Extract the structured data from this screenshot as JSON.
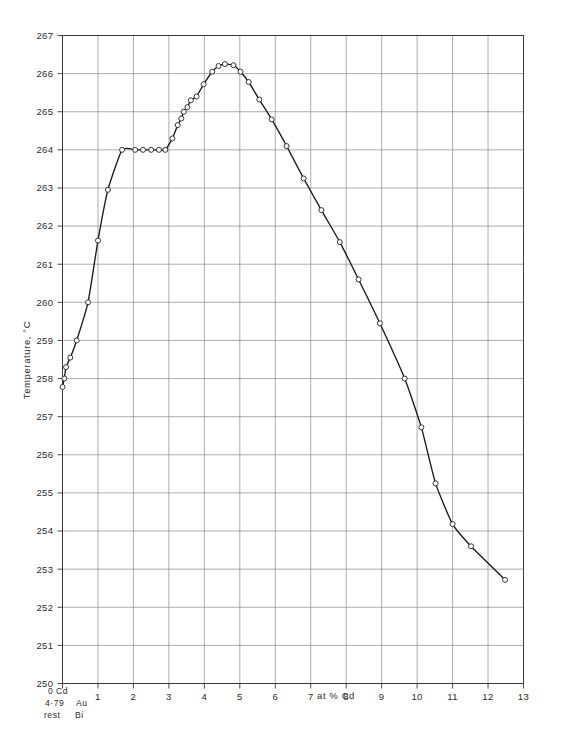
{
  "chart_data": {
    "type": "line",
    "title": "",
    "xlabel": "at % Cd",
    "ylabel": "Temperature, °C",
    "xlim": [
      0,
      13
    ],
    "ylim": [
      250,
      267
    ],
    "grid": true,
    "legend": "none",
    "x_ticks": [
      "0",
      "1",
      "2",
      "3",
      "4",
      "5",
      "6",
      "7",
      "8",
      "9",
      "10",
      "11",
      "12",
      "13"
    ],
    "x_tick_values": [
      0,
      1,
      2,
      3,
      4,
      5,
      6,
      7,
      8,
      9,
      10,
      11,
      12,
      13
    ],
    "y_ticks": [
      "250",
      "251",
      "252",
      "253",
      "254",
      "255",
      "256",
      "257",
      "258",
      "259",
      "260",
      "261",
      "262",
      "263",
      "264",
      "265",
      "266",
      "267"
    ],
    "y_tick_values": [
      250,
      251,
      252,
      253,
      254,
      255,
      256,
      257,
      258,
      259,
      260,
      261,
      262,
      263,
      264,
      265,
      266,
      267
    ],
    "series": [
      {
        "name": "liquidus",
        "marker": "open-circle",
        "color": "#1a1a1a",
        "points": [
          [
            0.0,
            257.78
          ],
          [
            0.05,
            258.0
          ],
          [
            0.1,
            258.3
          ],
          [
            0.22,
            258.55
          ],
          [
            0.4,
            259.0
          ],
          [
            0.72,
            260.0
          ],
          [
            1.0,
            261.62
          ],
          [
            1.28,
            262.95
          ],
          [
            1.68,
            264.0
          ],
          [
            2.05,
            264.0
          ],
          [
            2.27,
            264.0
          ],
          [
            2.5,
            264.0
          ],
          [
            2.72,
            264.0
          ],
          [
            2.9,
            264.0
          ],
          [
            3.1,
            264.3
          ],
          [
            3.25,
            264.65
          ],
          [
            3.35,
            264.82
          ],
          [
            3.42,
            265.0
          ],
          [
            3.52,
            265.12
          ],
          [
            3.62,
            265.3
          ],
          [
            3.78,
            265.4
          ],
          [
            3.98,
            265.72
          ],
          [
            4.22,
            266.05
          ],
          [
            4.4,
            266.2
          ],
          [
            4.58,
            266.25
          ],
          [
            4.82,
            266.22
          ],
          [
            5.02,
            266.05
          ],
          [
            5.25,
            265.78
          ],
          [
            5.55,
            265.32
          ],
          [
            5.9,
            264.8
          ],
          [
            6.32,
            264.1
          ],
          [
            6.8,
            263.25
          ],
          [
            7.3,
            262.42
          ],
          [
            7.82,
            261.58
          ],
          [
            8.35,
            260.6
          ],
          [
            8.95,
            259.45
          ],
          [
            9.65,
            258.0
          ],
          [
            10.12,
            256.72
          ],
          [
            10.52,
            255.25
          ],
          [
            11.0,
            254.18
          ],
          [
            11.52,
            253.6
          ],
          [
            12.48,
            252.72
          ]
        ]
      }
    ],
    "annotations": [
      {
        "name": "composition-note",
        "lines": [
          "0 Cd",
          "4·79   Au",
          "rest  Bi"
        ]
      }
    ]
  },
  "axes": {
    "x_axis_title": "at  %  Cd",
    "y_axis_title": "Temperature, °C"
  },
  "corner_note": {
    "line1_left": "0",
    "line1_right": "Cd",
    "line2_left": "4·79",
    "line2_right": "Au",
    "line3_left": "rest",
    "line3_right": "Bi"
  },
  "colors": {
    "grid": "#8a8a8a",
    "axis": "#3a3a3a",
    "curve": "#1a1a1a",
    "marker_fill": "#ffffff",
    "marker_stroke": "#2b2b2b",
    "text": "#2b2b2b",
    "background": "#ffffff"
  }
}
